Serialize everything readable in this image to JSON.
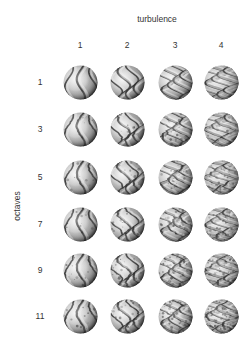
{
  "figure": {
    "title": "turbulence",
    "ylabel": "octaves",
    "columns": [
      {
        "label": "1",
        "x": 80,
        "turbulence": 1
      },
      {
        "label": "2",
        "x": 127,
        "turbulence": 2
      },
      {
        "label": "3",
        "x": 175,
        "turbulence": 3
      },
      {
        "label": "4",
        "x": 221,
        "turbulence": 4
      }
    ],
    "rows": [
      {
        "label": "1",
        "y": 82,
        "octaves": 1
      },
      {
        "label": "3",
        "y": 129,
        "octaves": 3
      },
      {
        "label": "5",
        "y": 177,
        "octaves": 5
      },
      {
        "label": "7",
        "y": 224,
        "octaves": 7
      },
      {
        "label": "9",
        "y": 270,
        "octaves": 9
      },
      {
        "label": "11",
        "y": 316,
        "octaves": 11
      }
    ],
    "colors": {
      "background": "#ffffff",
      "text": "#333333",
      "sphere_light": "#f2f2f2",
      "sphere_mid": "#9a9a9a",
      "sphere_dark": "#2a2a2a"
    }
  }
}
